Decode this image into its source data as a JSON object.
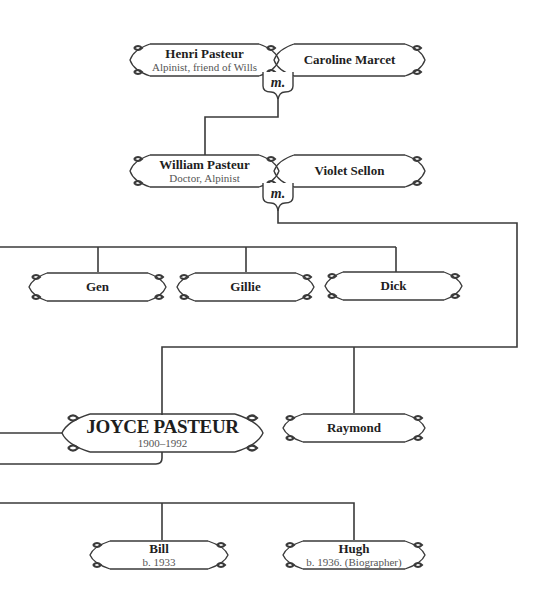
{
  "diagram": {
    "type": "family-tree",
    "colors": {
      "line": "#3a3a3a",
      "frame": "#3a3a3a",
      "text": "#1e1e1e",
      "subtext": "#555555",
      "background": "#ffffff"
    },
    "marriage_label": "m.",
    "generation1": {
      "husband": {
        "name": "Henri Pasteur",
        "note": "Alpinist, friend of Wills"
      },
      "wife": {
        "name": "Caroline Marcet"
      }
    },
    "generation2": {
      "husband": {
        "name": "William Pasteur",
        "note": "Doctor, Alpinist"
      },
      "wife": {
        "name": "Violet Sellon"
      }
    },
    "generation3": {
      "children": [
        {
          "name": "Gen"
        },
        {
          "name": "Gillie"
        },
        {
          "name": "Dick"
        },
        {
          "name": "JOYCE PASTEUR",
          "note": "1900–1992"
        },
        {
          "name": "Raymond"
        }
      ]
    },
    "generation4": {
      "children": [
        {
          "name": "Bill",
          "note": "b. 1933"
        },
        {
          "name": "Hugh",
          "note": "b. 1936. (Biographer)"
        }
      ]
    }
  }
}
